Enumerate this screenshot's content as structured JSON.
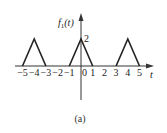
{
  "figure": {
    "caption": "(a)",
    "y_axis_label": "f",
    "y_axis_subscript": "1",
    "y_axis_arg": "(t)",
    "x_axis_label": "t",
    "peak_label": "2"
  },
  "chart_data": {
    "type": "line",
    "title": "f1(t)",
    "xlabel": "t",
    "ylabel": "f1(t)",
    "x_ticks": [
      -5,
      -4,
      -3,
      -2,
      -1,
      0,
      1,
      2,
      3,
      4,
      5
    ],
    "x_tick_labels": [
      "-5",
      "-4",
      "-3",
      "-2",
      "-1",
      "0",
      "1",
      "2",
      "3",
      "4",
      "5"
    ],
    "y_ticks": [
      2
    ],
    "y_tick_labels": [
      "2"
    ],
    "series": [
      {
        "name": "triangle-left",
        "x": [
          -5,
          -4,
          -3
        ],
        "y": [
          0,
          2,
          0
        ]
      },
      {
        "name": "triangle-center",
        "x": [
          -1,
          0,
          1
        ],
        "y": [
          0,
          2,
          0
        ]
      },
      {
        "name": "triangle-right",
        "x": [
          3,
          4,
          5
        ],
        "y": [
          0,
          2,
          0
        ]
      }
    ],
    "xlim": [
      -5.5,
      6
    ],
    "ylim": [
      -2.5,
      3.5
    ],
    "grid": false,
    "caption": "(a)"
  }
}
